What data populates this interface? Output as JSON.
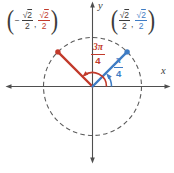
{
  "colors": {
    "red": "#c23a2b",
    "blue": "#3e7cc4",
    "dark": "#3c3c3c",
    "axis": "#4f4f4f",
    "circle": "#5c5c5c",
    "background": "#ffffff"
  },
  "axis_labels": {
    "x": "x",
    "y": "y"
  },
  "angle_labels": {
    "red": {
      "numerator": "3π",
      "denominator": "4"
    },
    "blue": {
      "numerator": "π",
      "denominator": "4"
    }
  },
  "point_labels": {
    "left": {
      "open": "(",
      "close": ")",
      "comma": ",",
      "x": {
        "sign": "−",
        "radical": "√",
        "radicand": "2",
        "denominator": "2"
      },
      "y": {
        "radical": "√",
        "radicand": "2",
        "denominator": "2"
      }
    },
    "right": {
      "open": "(",
      "close": ")",
      "comma": ",",
      "x": {
        "radical": "√",
        "radicand": "2",
        "denominator": "2"
      },
      "y": {
        "radical": "√",
        "radicand": "2",
        "denominator": "2"
      }
    }
  }
}
